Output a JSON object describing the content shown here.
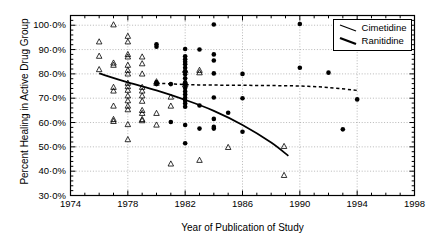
{
  "chart_data": {
    "type": "scatter",
    "title": "",
    "xlabel": "Year of Publication of Study",
    "ylabel": "Percent Healing in Active Drug Group",
    "xlim": [
      1974,
      1998
    ],
    "ylim": [
      30,
      104
    ],
    "grid": true,
    "x_ticks": [
      1974,
      1978,
      1982,
      1986,
      1990,
      1994,
      1998
    ],
    "x_tick_labels": [
      "1974",
      "1978",
      "1982",
      "1986",
      "1990",
      "1994",
      "1998"
    ],
    "x_minor_step": 1,
    "y_ticks": [
      30,
      40,
      50,
      60,
      70,
      80,
      90,
      100
    ],
    "y_tick_labels": [
      "30·0%",
      "40·0%",
      "50·0%",
      "60·0%",
      "70·0%",
      "80·0%",
      "90·0%",
      "100·0%"
    ],
    "y_minor_step": 2,
    "legend_position": "top-right",
    "legend": [
      {
        "name": "Cimetidine",
        "marker": "open-triangle",
        "line_style": "dashed",
        "line_width": 1.2,
        "color": "#000000"
      },
      {
        "name": "Ranitidine",
        "marker": "filled-circle",
        "line_style": "solid",
        "line_width": 1.8,
        "color": "#000000"
      }
    ],
    "series": [
      {
        "name": "Cimetidine",
        "marker": "open-triangle",
        "points": [
          [
            1976.0,
            81.8
          ],
          [
            1976.0,
            93.2
          ],
          [
            1976.0,
            87.3
          ],
          [
            1977.0,
            84.5
          ],
          [
            1977.0,
            83.6
          ],
          [
            1977.0,
            74.5
          ],
          [
            1977.0,
            73.0
          ],
          [
            1977.0,
            66.8
          ],
          [
            1977.0,
            61.3
          ],
          [
            1977.0,
            60.5
          ],
          [
            1977.0,
            100.2
          ],
          [
            1978.0,
            95.5
          ],
          [
            1978.0,
            93.2
          ],
          [
            1978.0,
            88.0
          ],
          [
            1978.0,
            87.0
          ],
          [
            1978.0,
            83.6
          ],
          [
            1978.0,
            81.5
          ],
          [
            1978.0,
            80.0
          ],
          [
            1978.0,
            76.2
          ],
          [
            1978.0,
            74.8
          ],
          [
            1978.0,
            73.3
          ],
          [
            1978.0,
            71.0
          ],
          [
            1978.0,
            69.0
          ],
          [
            1978.0,
            66.8
          ],
          [
            1978.0,
            65.3
          ],
          [
            1978.0,
            59.2
          ],
          [
            1978.0,
            53.0
          ],
          [
            1979.0,
            87.0
          ],
          [
            1979.0,
            84.2
          ],
          [
            1979.0,
            80.0
          ],
          [
            1979.0,
            74.5
          ],
          [
            1979.0,
            73.0
          ],
          [
            1979.0,
            71.0
          ],
          [
            1979.0,
            68.8
          ],
          [
            1979.0,
            65.0
          ],
          [
            1979.0,
            63.8
          ],
          [
            1979.0,
            61.3
          ],
          [
            1979.0,
            60.8
          ],
          [
            1980.0,
            76.8
          ],
          [
            1980.0,
            76.2
          ],
          [
            1980.0,
            63.8
          ],
          [
            1980.0,
            59.0
          ],
          [
            1981.0,
            70.5
          ],
          [
            1981.0,
            66.8
          ],
          [
            1981.0,
            43.0
          ],
          [
            1982.0,
            81.5
          ],
          [
            1982.0,
            76.5
          ],
          [
            1982.0,
            75.5
          ],
          [
            1983.0,
            81.5
          ],
          [
            1983.0,
            80.5
          ],
          [
            1983.0,
            44.5
          ],
          [
            1985.0,
            49.8
          ],
          [
            1988.9,
            50.2
          ],
          [
            1988.9,
            38.3
          ]
        ]
      },
      {
        "name": "Ranitidine",
        "marker": "filled-circle",
        "points": [
          [
            1980.0,
            92.2
          ],
          [
            1980.0,
            91.2
          ],
          [
            1980.0,
            76.5
          ],
          [
            1980.0,
            75.8
          ],
          [
            1981.0,
            75.8
          ],
          [
            1981.0,
            60.2
          ],
          [
            1982.0,
            90.2
          ],
          [
            1982.0,
            87.2
          ],
          [
            1982.0,
            86.0
          ],
          [
            1982.0,
            85.0
          ],
          [
            1982.0,
            84.0
          ],
          [
            1982.0,
            82.5
          ],
          [
            1982.0,
            81.0
          ],
          [
            1982.0,
            79.8
          ],
          [
            1982.0,
            78.2
          ],
          [
            1982.0,
            76.5
          ],
          [
            1982.0,
            75.5
          ],
          [
            1982.0,
            74.2
          ],
          [
            1982.0,
            72.8
          ],
          [
            1982.0,
            71.5
          ],
          [
            1982.0,
            70.2
          ],
          [
            1982.0,
            69.0
          ],
          [
            1982.0,
            67.8
          ],
          [
            1982.0,
            66.5
          ],
          [
            1982.0,
            59.0
          ],
          [
            1982.0,
            51.5
          ],
          [
            1983.0,
            90.0
          ],
          [
            1983.0,
            67.0
          ],
          [
            1983.0,
            57.5
          ],
          [
            1984.0,
            100.3
          ],
          [
            1984.0,
            88.0
          ],
          [
            1984.0,
            85.5
          ],
          [
            1984.0,
            80.2
          ],
          [
            1984.0,
            70.3
          ],
          [
            1984.0,
            61.5
          ],
          [
            1984.0,
            58.2
          ],
          [
            1984.0,
            57.5
          ],
          [
            1985.0,
            64.0
          ],
          [
            1986.0,
            80.0
          ],
          [
            1986.0,
            70.0
          ],
          [
            1986.0,
            56.2
          ],
          [
            1990.0,
            100.5
          ],
          [
            1990.0,
            82.5
          ],
          [
            1992.0,
            80.5
          ],
          [
            1993.0,
            57.2
          ],
          [
            1994.0,
            69.5
          ]
        ]
      }
    ],
    "trend_lines": [
      {
        "name": "Cimetidine",
        "style": "dashed",
        "points": [
          [
            1980.0,
            76.2
          ],
          [
            1982.0,
            75.6
          ],
          [
            1984.0,
            75.4
          ],
          [
            1986.0,
            75.3
          ],
          [
            1988.0,
            75.2
          ],
          [
            1990.0,
            75.0
          ],
          [
            1992.0,
            74.4
          ],
          [
            1994.0,
            73.2
          ]
        ]
      },
      {
        "name": "Ranitidine",
        "style": "solid",
        "points": [
          [
            1976.0,
            80.2
          ],
          [
            1978.0,
            76.5
          ],
          [
            1980.0,
            73.2
          ],
          [
            1982.0,
            69.3
          ],
          [
            1984.0,
            64.8
          ],
          [
            1986.0,
            59.0
          ],
          [
            1988.0,
            51.8
          ],
          [
            1989.2,
            46.3
          ]
        ]
      }
    ]
  }
}
